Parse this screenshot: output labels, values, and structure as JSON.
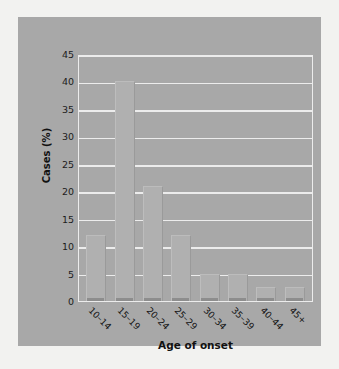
{
  "chart_data": {
    "type": "bar",
    "title": "",
    "xlabel": "Age of onset",
    "ylabel": "Cases (%)",
    "categories": [
      "10–14",
      "15–19",
      "20–24",
      "25–29",
      "30–34",
      "35–39",
      "40–44",
      "45+"
    ],
    "values": [
      12,
      40,
      21,
      12,
      5,
      5,
      2.5,
      2.5
    ],
    "ylim": [
      0,
      45
    ],
    "ytick_labels": [
      "45",
      "40",
      "35",
      "30",
      "25",
      "20",
      "15",
      "10",
      "5",
      "0"
    ],
    "ytick_values": [
      45,
      40,
      35,
      30,
      25,
      20,
      15,
      10,
      5,
      0
    ],
    "ytick_step": 5,
    "grid": true,
    "legend": false,
    "colors": {
      "page_background": "#f2f2f0",
      "panel_background": "#a8a8a8",
      "bar_fill": "#b0b0b0",
      "bar_shadow": "#8d8d8d",
      "gridline": "#ececec",
      "axis_text": "#1c1c1c"
    }
  }
}
